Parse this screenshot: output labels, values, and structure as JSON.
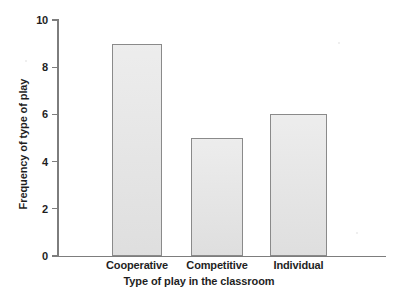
{
  "chart_data": {
    "type": "bar",
    "title": "",
    "xlabel": "Type of play in the classroom",
    "ylabel": "Frequency of type of play",
    "categories": [
      "Cooperative",
      "Competitive",
      "Individual"
    ],
    "values": [
      9,
      5,
      6
    ],
    "series": [
      {
        "name": "Frequency of type of play",
        "values": [
          9,
          5,
          6
        ]
      }
    ],
    "ylim": [
      0,
      10
    ],
    "yticks": [
      0,
      2,
      4,
      6,
      8,
      10
    ],
    "ytick_labels": [
      "0",
      "2",
      "4",
      "6",
      "8",
      "10"
    ],
    "grid": false,
    "legend": null,
    "legend_position": "none",
    "bar_fill_color": "#e3e3e3",
    "bar_border_color": "#8a8a8a",
    "axis_color": "#7d7d7d",
    "background_color": "#ffffff",
    "text_color": "#1f1f1f"
  }
}
